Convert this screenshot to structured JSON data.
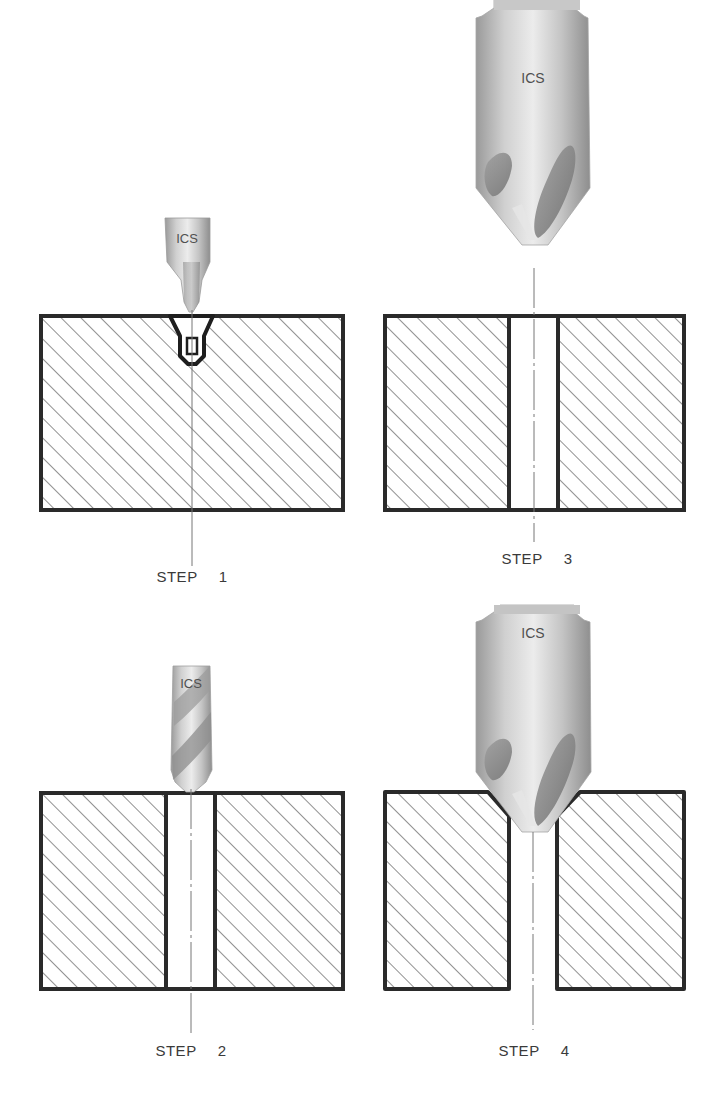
{
  "diagram": {
    "type": "process-steps",
    "tool_brand_text": "ICS",
    "colors": {
      "outline": "#2a2a2a",
      "hatch": "#555555",
      "centerline": "#777777",
      "tool_light": "#e8e8e8",
      "tool_mid": "#b4b4b4",
      "tool_dark": "#8a8a8a"
    },
    "steps": [
      {
        "id": 1,
        "label": "STEP  1",
        "tool": "center drill (spot drill)",
        "operation": "spot drill pilot / center hole"
      },
      {
        "id": 2,
        "label": "STEP  2",
        "tool": "twist drill",
        "operation": "drill through hole"
      },
      {
        "id": 3,
        "label": "STEP  3",
        "tool": "countersink",
        "operation": "countersink positioned above drilled hole"
      },
      {
        "id": 4,
        "label": "STEP  4",
        "tool": "countersink",
        "operation": "countersink chamfer on hole edge"
      }
    ]
  }
}
